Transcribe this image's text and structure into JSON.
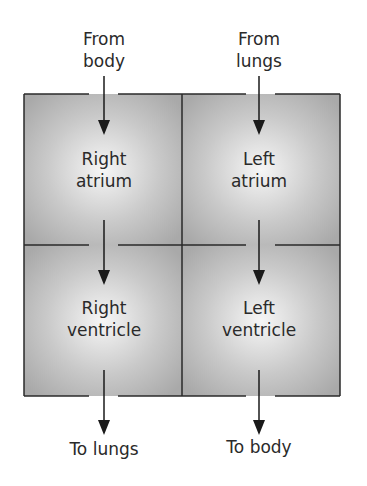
{
  "inputs": [
    {
      "id": "from-body",
      "text_line1": "From",
      "text_line2": "body"
    },
    {
      "id": "from-lungs",
      "text_line1": "From",
      "text_line2": "lungs"
    }
  ],
  "chambers": [
    {
      "id": "right-atrium",
      "line1": "Right",
      "line2": "atrium"
    },
    {
      "id": "left-atrium",
      "line1": "Left",
      "line2": "atrium"
    },
    {
      "id": "right-ventricle",
      "line1": "Right",
      "line2": "ventricle"
    },
    {
      "id": "left-ventricle",
      "line1": "Left",
      "line2": "ventricle"
    }
  ],
  "outputs": [
    {
      "id": "to-lungs",
      "text": "To lungs"
    },
    {
      "id": "to-body",
      "text": "To body"
    }
  ],
  "colors": {
    "chamber_fill_edge": "#a8a8a8",
    "chamber_fill_center": "#f4f4f4",
    "line": "#2a2a2a"
  }
}
